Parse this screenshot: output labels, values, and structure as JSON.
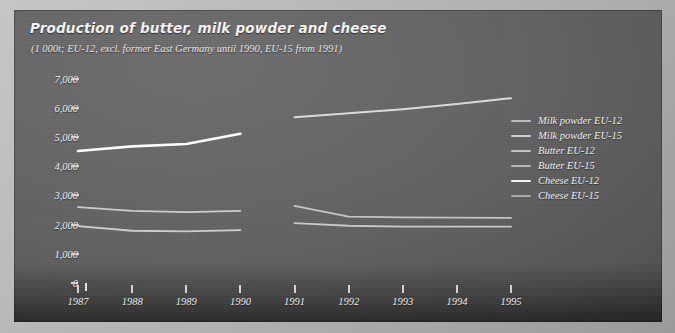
{
  "title": "Production of butter, milk powder and cheese",
  "subtitle": "(1 000t; EU-12, excl. former East Germany until 1990, EU-15 from 1991)",
  "colors": {
    "panel_bg": "#646464",
    "page_bg": "#b9b9b9",
    "cheese_eu12": "#ffffff",
    "cheese_eu15": "#d8d8d8",
    "butter_eu12": "#cfcfcf",
    "butter_eu15": "#c4c4c4",
    "milk_eu12": "#d2d2d2",
    "milk_eu15": "#c9c9c9",
    "axis": "#e8e8e8",
    "text": "#f0f0f0"
  },
  "legend": {
    "position": "right",
    "items": [
      {
        "label": "Milk powder EU-12",
        "color": "#bdbdbd"
      },
      {
        "label": "Milk powder EU-15",
        "color": "#cfcfcf"
      },
      {
        "label": "Butter EU-12",
        "color": "#c2c2c2"
      },
      {
        "label": "Butter EU-15",
        "color": "#b5b5b5"
      },
      {
        "label": "Cheese EU-12",
        "color": "#f2f2f2"
      },
      {
        "label": "Cheese EU-15",
        "color": "#a8a8a8"
      }
    ]
  },
  "chart_data": {
    "type": "line",
    "title": "Production of butter, milk powder and cheese",
    "subtitle": "(1 000t; EU-12, excl. former East Germany until 1990, EU-15 from 1991)",
    "xlabel": "",
    "ylabel": "1 000t",
    "x": [
      1987,
      1988,
      1989,
      1990,
      1991,
      1992,
      1993,
      1994,
      1995
    ],
    "xtick_labels": [
      "1987",
      "1988",
      "1989",
      "1990",
      "1991",
      "1992",
      "1993",
      "1994",
      "1995"
    ],
    "ytick_labels": [
      "0",
      "1,000",
      "2,000",
      "3,000",
      "4,000",
      "5,000",
      "6,000",
      "7,000"
    ],
    "ytick_values": [
      0,
      1000,
      2000,
      3000,
      4000,
      5000,
      6000,
      7000
    ],
    "ylim": [
      0,
      7400
    ],
    "xlim": [
      1986.6,
      1995.4
    ],
    "grid": false,
    "gap_note": "Series break between 1990 (EU-12) and 1991 (EU-15)",
    "series": [
      {
        "name": "Cheese EU-12",
        "color": "#ffffff",
        "width": 2.6,
        "x": [
          1987,
          1988,
          1989,
          1990
        ],
        "values": [
          4520,
          4680,
          4760,
          5110
        ]
      },
      {
        "name": "Cheese EU-15",
        "color": "#dedede",
        "width": 2.0,
        "x": [
          1991,
          1992,
          1993,
          1994,
          1995
        ],
        "values": [
          5680,
          5810,
          5950,
          6130,
          6330
        ]
      },
      {
        "name": "Butter EU-12",
        "color": "#cfcfcf",
        "width": 1.8,
        "x": [
          1987,
          1988,
          1989,
          1990
        ],
        "values": [
          2600,
          2470,
          2430,
          2470
        ]
      },
      {
        "name": "Butter EU-15",
        "color": "#c8c8c8",
        "width": 1.8,
        "x": [
          1991,
          1992,
          1993,
          1994,
          1995
        ],
        "values": [
          2640,
          2270,
          2250,
          2240,
          2230
        ]
      },
      {
        "name": "Milk powder EU-12",
        "color": "#d2d2d2",
        "width": 1.8,
        "x": [
          1987,
          1988,
          1989,
          1990
        ],
        "values": [
          1950,
          1790,
          1770,
          1810
        ]
      },
      {
        "name": "Milk powder EU-15",
        "color": "#cbcbcb",
        "width": 1.8,
        "x": [
          1991,
          1992,
          1993,
          1994,
          1995
        ],
        "values": [
          2050,
          1960,
          1930,
          1930,
          1930
        ]
      }
    ]
  }
}
